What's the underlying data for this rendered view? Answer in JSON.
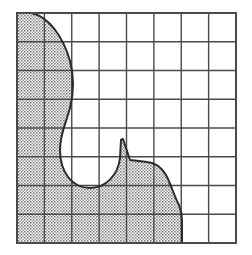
{
  "figure": {
    "type": "grid-region-diagram",
    "title": "",
    "colors": {
      "background": "#ffffff",
      "grid_line": "#4a4a4a",
      "region_outline": "#2b2b2b",
      "region_fill_dot": "#6e6e6e",
      "region_fill_base": "#ffffff"
    },
    "grid": {
      "columns": 8,
      "rows": 8,
      "x0": 17,
      "y0": 13,
      "x1": 236,
      "y1": 243,
      "cell_width": 27.375,
      "cell_height": 28.75,
      "outer_border_width": 2.0,
      "inner_line_width": 1.4,
      "show_grid": true
    },
    "region": {
      "fill_pattern": "stipple-dots",
      "outline_width": 2.0,
      "closed": true,
      "path": "M 17 13 L 31 13 C 48 16 63 36 70 61 C 74 76 74 92 70 108 C 65 126 60 134 60 150 C 60 172 72 188 90 188 C 106 188 118 175 120 158 L 121 140 L 123 139 L 130 160 L 139 161 L 147 162 C 157 163 162 168 166 175 C 171 184 174 196 179 205 C 181 210 182 216 182 221 L 182 243 L 17 243 Z"
    },
    "region_vertices": [
      {
        "x": 17,
        "y": 13
      },
      {
        "x": 31,
        "y": 13
      },
      {
        "x": 70,
        "y": 61
      },
      {
        "x": 70,
        "y": 108
      },
      {
        "x": 60,
        "y": 150
      },
      {
        "x": 90,
        "y": 188
      },
      {
        "x": 120,
        "y": 158
      },
      {
        "x": 123,
        "y": 139
      },
      {
        "x": 147,
        "y": 162
      },
      {
        "x": 179,
        "y": 205
      },
      {
        "x": 182,
        "y": 243
      },
      {
        "x": 17,
        "y": 243
      }
    ]
  }
}
